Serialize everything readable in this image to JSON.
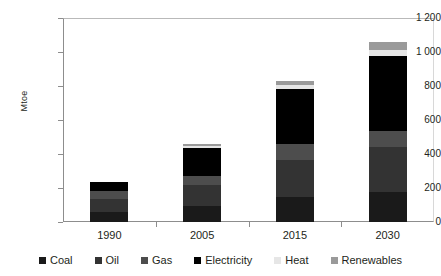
{
  "chart_data": {
    "type": "bar",
    "stacked": true,
    "title": "",
    "xlabel": "",
    "ylabel": "Mtoe",
    "categories": [
      "1990",
      "2005",
      "2015",
      "2030"
    ],
    "ylim": [
      0,
      1200
    ],
    "yticks": [
      "0",
      "200",
      "400",
      "600",
      "800",
      "1 000",
      "1 200"
    ],
    "ytick_values": [
      0,
      200,
      400,
      600,
      800,
      1000,
      1200
    ],
    "grid": false,
    "legend_position": "bottom",
    "series": [
      {
        "name": "Coal",
        "color": "#1a1a1a",
        "values": [
          60,
          95,
          150,
          175
        ]
      },
      {
        "name": "Oil",
        "color": "#333333",
        "values": [
          75,
          120,
          215,
          265
        ]
      },
      {
        "name": "Gas",
        "color": "#4d4d4d",
        "values": [
          45,
          55,
          95,
          95
        ]
      },
      {
        "name": "Electricity",
        "color": "#000000",
        "values": [
          55,
          165,
          325,
          440
        ]
      },
      {
        "name": "Heat",
        "color": "#e6e6e6",
        "values": [
          0,
          10,
          20,
          35
        ]
      },
      {
        "name": "Renewables",
        "color": "#9a9a9a",
        "values": [
          0,
          15,
          25,
          50
        ]
      }
    ],
    "totals": [
      235,
      460,
      830,
      1060
    ]
  },
  "legend": {
    "items": [
      {
        "label": "Coal",
        "color": "#1a1a1a"
      },
      {
        "label": "Oil",
        "color": "#333333"
      },
      {
        "label": "Gas",
        "color": "#4d4d4d"
      },
      {
        "label": "Electricity",
        "color": "#000000"
      },
      {
        "label": "Heat",
        "color": "#e6e6e6"
      },
      {
        "label": "Renewables",
        "color": "#9a9a9a"
      }
    ]
  }
}
